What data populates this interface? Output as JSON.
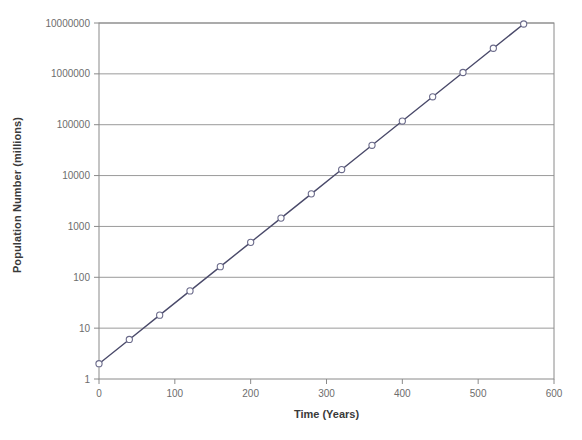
{
  "chart_data": {
    "type": "line",
    "title": "",
    "subtitle": "",
    "xlabel": "Time (Years)",
    "ylabel": "Population Number (millions)",
    "yscale": "log",
    "xscale": "linear",
    "xlim": [
      0,
      600
    ],
    "ylim": [
      1,
      10000000
    ],
    "grid": "horizontal",
    "legend": "none",
    "marker": "open-circle",
    "line_color": "#4a4a6a",
    "marker_edge_color": "#6a6a8a",
    "marker_face_color": "#ffffff",
    "grid_color": "#9a9a9a",
    "border_color": "#8a8a8a",
    "x_ticks": [
      0,
      100,
      200,
      300,
      400,
      500,
      600
    ],
    "x_tick_labels": [
      "0",
      "100",
      "200",
      "300",
      "400",
      "500",
      "600"
    ],
    "y_ticks": [
      1,
      10,
      100,
      1000,
      10000,
      100000,
      1000000,
      10000000
    ],
    "y_tick_labels": [
      "1",
      "10",
      "100",
      "1000",
      "10000",
      "100000",
      "1000000",
      "10000000"
    ],
    "x": [
      0,
      40,
      80,
      120,
      160,
      200,
      240,
      280,
      320,
      360,
      400,
      440,
      480,
      520,
      560
    ],
    "values": [
      2,
      6,
      18,
      54,
      162,
      486,
      1458,
      4374,
      13122,
      39366,
      118098,
      354294,
      1062882,
      3188646,
      9565938
    ],
    "series": [
      {
        "name": "Population",
        "x": [
          0,
          40,
          80,
          120,
          160,
          200,
          240,
          280,
          320,
          360,
          400,
          440,
          480,
          520,
          560
        ],
        "values": [
          2,
          6,
          18,
          54,
          162,
          486,
          1458,
          4374,
          13122,
          39366,
          118098,
          354294,
          1062882,
          3188646,
          9565938
        ]
      }
    ],
    "annotations": []
  },
  "plot_geometry": {
    "left": 99,
    "right": 554,
    "top": 23,
    "bottom": 379
  }
}
